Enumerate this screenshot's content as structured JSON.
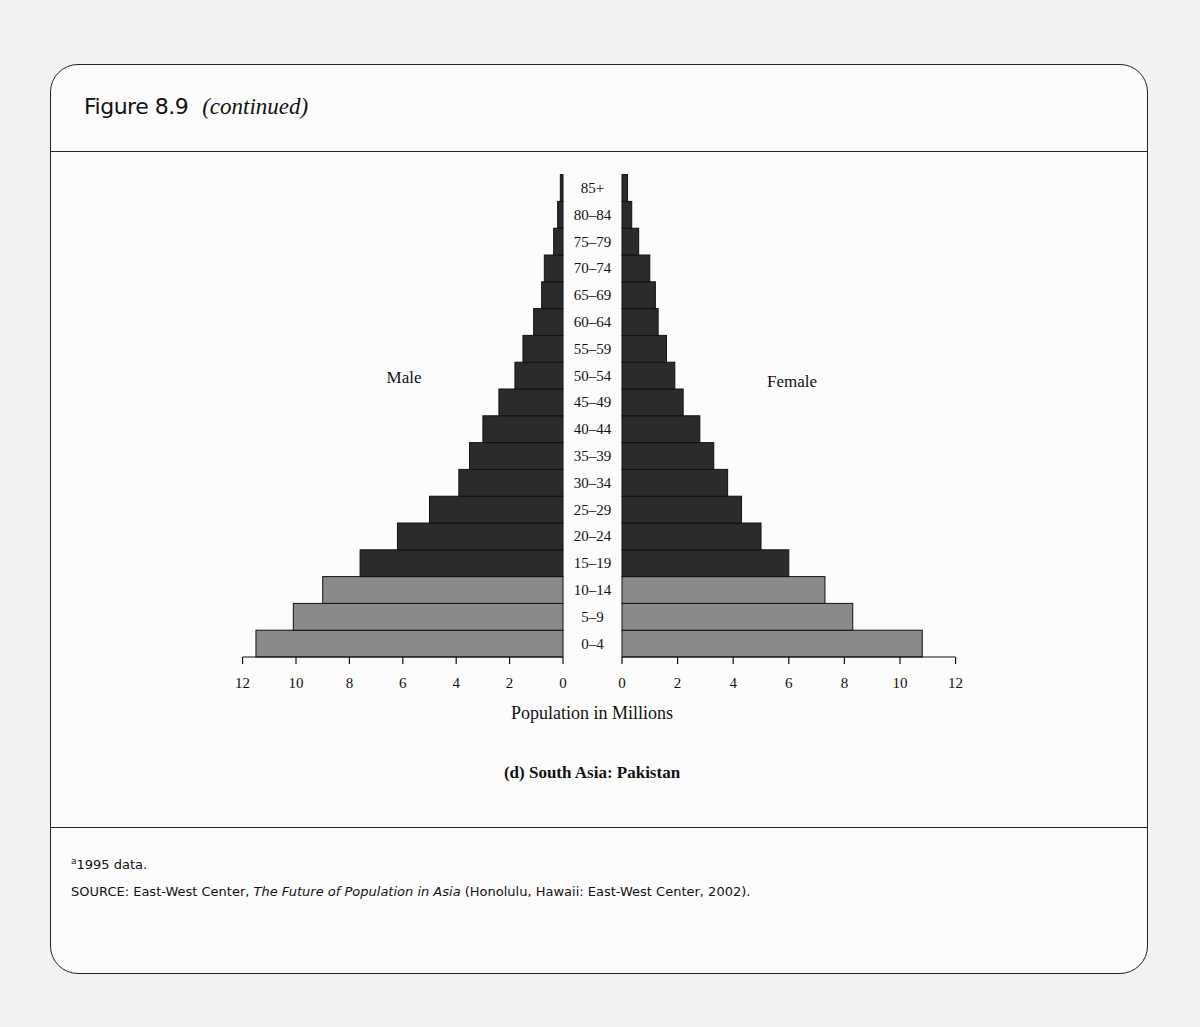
{
  "figure": {
    "number": "Figure 8.9",
    "continued": "(continued)",
    "subtitle": "(d) South Asia: Pakistan",
    "footnote": "a1995 data.",
    "footnote_marker": "a",
    "footnote_text": "1995 data.",
    "source_prefix": "SOURCE: East-West Center, ",
    "source_title": "The Future of Population in Asia",
    "source_suffix": " (Honolulu, Hawaii: East-West Center, 2002)."
  },
  "chart_data": {
    "type": "bar",
    "orientation": "horizontal-population-pyramid",
    "title": "(d) South Asia: Pakistan",
    "xlabel": "Population in Millions",
    "ylabel": "",
    "xlim": [
      0,
      12
    ],
    "x_ticks": [
      0,
      2,
      4,
      6,
      8,
      10,
      12
    ],
    "grid": false,
    "legend": "none",
    "annotations": [
      "Male",
      "Female"
    ],
    "categories": [
      "0–4",
      "5–9",
      "10–14",
      "15–19",
      "20–24",
      "25–29",
      "30–34",
      "35–39",
      "40–44",
      "45–49",
      "50–54",
      "55–59",
      "60–64",
      "65–69",
      "70–74",
      "75–79",
      "80–84",
      "85+"
    ],
    "series": [
      {
        "name": "Male",
        "side": "left",
        "values": [
          11.5,
          10.1,
          9.0,
          7.6,
          6.2,
          5.0,
          3.9,
          3.5,
          3.0,
          2.4,
          1.8,
          1.5,
          1.1,
          0.8,
          0.7,
          0.35,
          0.2,
          0.1
        ]
      },
      {
        "name": "Female",
        "side": "right",
        "values": [
          10.8,
          8.3,
          7.3,
          6.0,
          5.0,
          4.3,
          3.8,
          3.3,
          2.8,
          2.2,
          1.9,
          1.6,
          1.3,
          1.2,
          1.0,
          0.6,
          0.35,
          0.2
        ]
      }
    ],
    "highlight": {
      "categories": [
        "0–4",
        "5–9",
        "10–14"
      ],
      "color": "#8a8a8a"
    },
    "colors": {
      "dark": "#2b2b2b",
      "light": "#8a8a8a"
    }
  }
}
